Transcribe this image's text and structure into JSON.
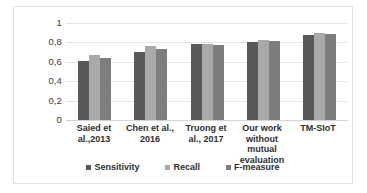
{
  "chart_data": {
    "type": "bar",
    "title": "",
    "xlabel": "",
    "ylabel": "",
    "ylim": [
      0,
      1
    ],
    "grid": true,
    "legend_position": "bottom",
    "y_ticks": [
      "0",
      "0,2",
      "0,4",
      "0,6",
      "0,8",
      "1"
    ],
    "y_tick_values": [
      0,
      0.2,
      0.4,
      0.6,
      0.8,
      1
    ],
    "categories": [
      "Saied et al.,2013",
      "Chen et al., 2016",
      "Truong et al., 2017",
      "Our work without mutual evaluation",
      "TM-SIoT"
    ],
    "series": [
      {
        "name": "Sensitivity",
        "color": "#595959",
        "values": [
          0.61,
          0.7,
          0.785,
          0.805,
          0.875
        ]
      },
      {
        "name": "Recall",
        "color": "#a9a9a9",
        "values": [
          0.67,
          0.76,
          0.785,
          0.825,
          0.895
        ]
      },
      {
        "name": "F-measure",
        "color": "#7d7d7d",
        "values": [
          0.635,
          0.73,
          0.77,
          0.81,
          0.885
        ]
      }
    ]
  }
}
